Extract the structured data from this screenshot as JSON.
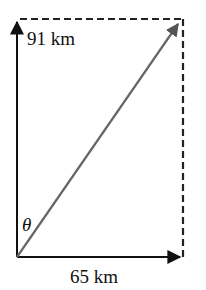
{
  "diagram": {
    "type": "vector-diagram",
    "vertical_vector": {
      "label": "91 km",
      "direction": "north"
    },
    "horizontal_vector": {
      "label": "65 km",
      "direction": "east"
    },
    "resultant_vector": {
      "label": "",
      "color": "#666666"
    },
    "angle": {
      "symbol": "θ",
      "between": "vertical vector and resultant"
    },
    "completion_lines": {
      "style": "dashed",
      "sides": [
        "top",
        "right"
      ]
    },
    "colors": {
      "axis_arrows": "#111111",
      "resultant": "#666666",
      "dashed": "#222222",
      "background": "#ffffff"
    }
  }
}
